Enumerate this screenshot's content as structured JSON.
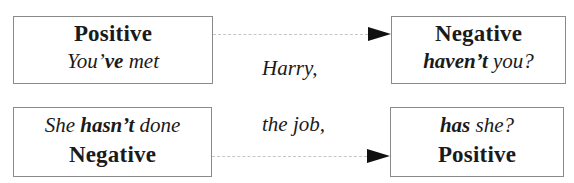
{
  "row1": {
    "left_box": {
      "title": "Positive",
      "sentence_pre": "You’",
      "sentence_bold": "ve",
      "sentence_post": " met"
    },
    "middle_text": "Harry,",
    "right_box": {
      "title": "Negative",
      "tag_bold": "haven’t",
      "tag_post": " you?"
    }
  },
  "row2": {
    "left_box": {
      "sentence_pre": "She ",
      "sentence_bold": "hasn’t",
      "sentence_post": " done",
      "title": "Negative"
    },
    "middle_text": "the job,",
    "right_box": {
      "tag_bold": "has",
      "tag_post": " she?",
      "title": "Positive"
    }
  },
  "colors": {
    "box_border": "#8a8a8a",
    "connector": "#c6c6c6",
    "arrowhead": "#111111",
    "text": "#1a1a1a"
  }
}
